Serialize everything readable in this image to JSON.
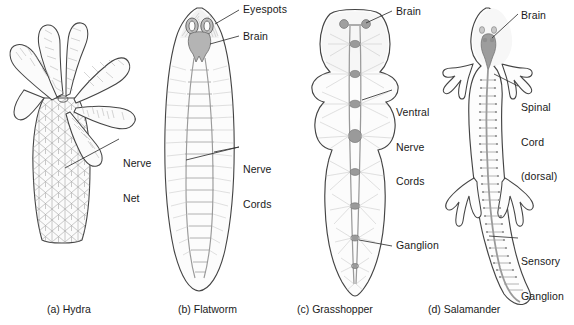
{
  "figure": {
    "background": "#ffffff",
    "ink": "#3a3a3a",
    "tissue_fill": "#fafafa",
    "nerve_color": "#8f8f8f",
    "ganglion_color": "#9a9a9a"
  },
  "panels": [
    {
      "id": "hydra",
      "caption": "(a) Hydra",
      "system_type": "nerve net",
      "labels": [
        {
          "name": "nerve-net",
          "lines": [
            "Nerve",
            "Net"
          ]
        }
      ]
    },
    {
      "id": "flatworm",
      "caption": "(b) Flatworm",
      "system_type": "ladder-type nervous system",
      "labels": [
        {
          "name": "eyespots",
          "lines": [
            "Eyespots"
          ]
        },
        {
          "name": "brain",
          "lines": [
            "Brain"
          ]
        },
        {
          "name": "nerve-cords",
          "lines": [
            "Nerve",
            "Cords"
          ]
        }
      ]
    },
    {
      "id": "grasshopper",
      "caption": "(c) Grasshopper",
      "system_type": "ventral nerve cord with segmental ganglia",
      "labels": [
        {
          "name": "brain",
          "lines": [
            "Brain"
          ]
        },
        {
          "name": "ventral-nerve-cords",
          "lines": [
            "Ventral",
            "Nerve",
            "Cords"
          ]
        },
        {
          "name": "ganglion",
          "lines": [
            "Ganglion"
          ]
        }
      ]
    },
    {
      "id": "salamander",
      "caption": "(d) Salamander",
      "system_type": "dorsal spinal cord with sensory ganglia",
      "labels": [
        {
          "name": "brain",
          "lines": [
            "Brain"
          ]
        },
        {
          "name": "spinal-cord",
          "lines": [
            "Spinal",
            "Cord",
            "(dorsal)"
          ]
        },
        {
          "name": "sensory-ganglion",
          "lines": [
            "Sensory",
            "Ganglion"
          ]
        }
      ]
    }
  ],
  "text": {
    "hydra": {
      "caption": "(a) Hydra",
      "nerve_net_l1": "Nerve",
      "nerve_net_l2": "Net"
    },
    "flatworm": {
      "caption": "(b) Flatworm",
      "eyespots": "Eyespots",
      "brain": "Brain",
      "nerve_cords_l1": "Nerve",
      "nerve_cords_l2": "Cords"
    },
    "grasshopper": {
      "caption": "(c) Grasshopper",
      "brain": "Brain",
      "ventral_l1": "Ventral",
      "ventral_l2": "Nerve",
      "ventral_l3": "Cords",
      "ganglion": "Ganglion"
    },
    "salamander": {
      "caption": "(d) Salamander",
      "brain": "Brain",
      "spinal_l1": "Spinal",
      "spinal_l2": "Cord",
      "spinal_l3": "(dorsal)",
      "sensory_l1": "Sensory",
      "sensory_l2": "Ganglion"
    }
  }
}
